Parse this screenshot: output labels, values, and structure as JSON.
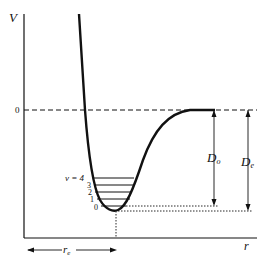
{
  "diagram": {
    "axes": {
      "y_label": "V",
      "x_label": "r",
      "zero_label": "0"
    },
    "quantum_label": "v = 4",
    "levels": [
      "3",
      "2",
      "1",
      "0"
    ],
    "dissociation_labels": {
      "d0": "D",
      "d0_sub": "o",
      "de": "D",
      "de_sub": "e"
    },
    "equilibrium_label": "r",
    "equilibrium_sub": "e",
    "colors": {
      "line": "#111111",
      "background": "#ffffff"
    }
  }
}
